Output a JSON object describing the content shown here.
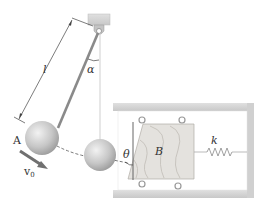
{
  "diagram": {
    "labels": {
      "length": "l",
      "angle_alpha": "α",
      "sphere": "A",
      "velocity": "v",
      "velocity_sub": "0",
      "angle_theta": "θ",
      "block": "B",
      "spring": "k"
    },
    "colors": {
      "wall": "#d4d4d4",
      "wall_edge": "#bdbdbd",
      "sphere": "#c8c8c8",
      "rod": "#8a8a8a",
      "block": "#e2e0dc",
      "block_grain": "#b8b4ae",
      "velocity_arrow": "#707070",
      "line": "#444444"
    }
  }
}
